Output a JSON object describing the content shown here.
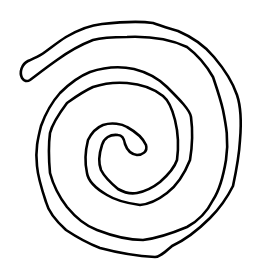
{
  "figure": {
    "background_color": "#ffffff",
    "stroke_color": "#000000",
    "stroke_width": 2.6
  }
}
